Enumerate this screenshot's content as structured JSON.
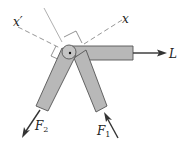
{
  "diagram": {
    "labels": {
      "x_prime": "x′",
      "x": "x",
      "L": "L",
      "F2_main": "F",
      "F2_sub": "2",
      "F1_main": "F",
      "F1_sub": "1"
    },
    "colors": {
      "member_fill": "#b8b8b8",
      "member_stroke": "#555555",
      "dashed_axis": "#8a8a8a",
      "arrow": "#333333"
    }
  }
}
